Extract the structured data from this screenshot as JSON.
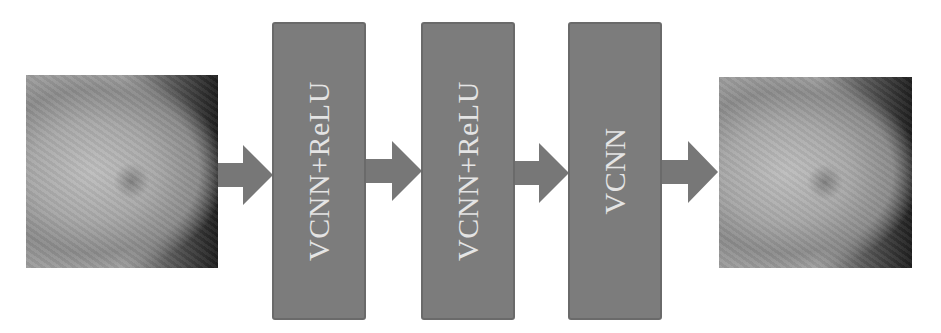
{
  "diagram": {
    "input_image": {
      "label": "input-mammogram-image"
    },
    "output_image": {
      "label": "output-mammogram-image"
    },
    "layers": [
      {
        "label": "VCNN+ReLU"
      },
      {
        "label": "VCNN+ReLU"
      },
      {
        "label": "VCNN"
      }
    ],
    "colors": {
      "box_fill": "#7c7c7c",
      "box_border": "#6a6a6a",
      "arrow": "#777777",
      "text": "#e4e4e4",
      "background": "#ffffff"
    }
  }
}
